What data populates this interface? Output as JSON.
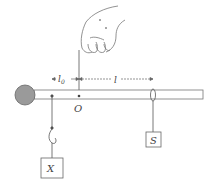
{
  "diagram": {
    "type": "lever-balance",
    "labels": {
      "pivot": "O",
      "left_distance": "l",
      "left_distance_sub": "0",
      "right_distance": "l",
      "left_mass": "X",
      "right_mass": "S"
    },
    "colors": {
      "line": "#555555",
      "ball_fill": "#9a9a9a",
      "rod_fill": "#ffffff"
    }
  }
}
